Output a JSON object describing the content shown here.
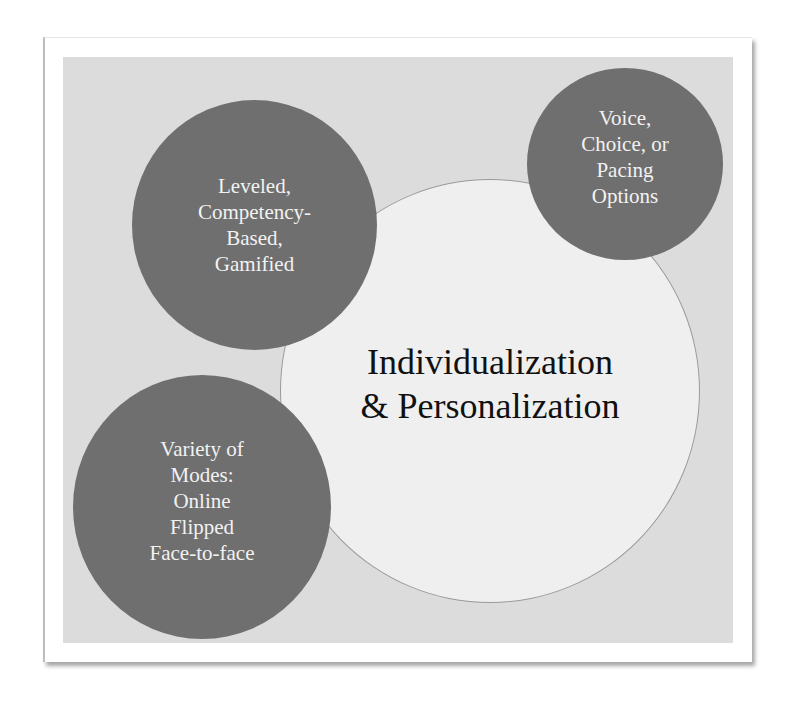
{
  "diagram": {
    "center": {
      "label": "Individualization\n& Personalization",
      "fill": "#efefef",
      "text_color": "#111111"
    },
    "satellites": [
      {
        "id": "top-left",
        "label": "Leveled,\nCompetency-\nBased,\nGamified",
        "fill": "#6f6f6f"
      },
      {
        "id": "top-right",
        "label": "Voice,\nChoice, or\nPacing\nOptions",
        "fill": "#6f6f6f"
      },
      {
        "id": "bottom-left",
        "label": "Variety of\nModes:\nOnline\nFlipped\nFace-to-face",
        "fill": "#6f6f6f"
      }
    ],
    "background": "#dcdcdc"
  }
}
